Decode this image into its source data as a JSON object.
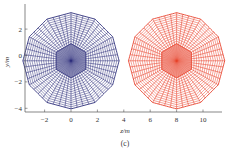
{
  "chart_data": {
    "type": "mesh",
    "panel_label": "(c)",
    "xlabel": "z/m",
    "ylabel": "y/m",
    "x_ticks": [
      -2,
      0,
      2,
      4,
      6,
      8,
      10
    ],
    "y_ticks": [
      2,
      0,
      -2,
      -4
    ],
    "xlim": [
      -3.6,
      11.4
    ],
    "ylim": [
      -4.3,
      3.9
    ],
    "series": [
      {
        "name": "mesh-left",
        "center_z": 0,
        "center_y": -0.4,
        "radius": 3.7,
        "hex_radius": 1.3,
        "rings": 14,
        "spokes": 48,
        "color": "#2e2f7a"
      },
      {
        "name": "mesh-right",
        "center_z": 8,
        "center_y": -0.4,
        "radius": 3.7,
        "hex_radius": 1.3,
        "rings": 14,
        "spokes": 48,
        "color": "#e8402a"
      }
    ]
  }
}
